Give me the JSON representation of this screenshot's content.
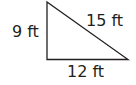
{
  "diagram": {
    "type": "right-triangle",
    "stroke_color": "#231f20",
    "vertices": {
      "top": [
        47,
        2
      ],
      "right_angle": [
        47,
        59
      ],
      "right": [
        128,
        59
      ]
    },
    "labels": {
      "left_side": "9 ft",
      "hypotenuse": "15 ft",
      "bottom_side": "12 ft"
    }
  }
}
